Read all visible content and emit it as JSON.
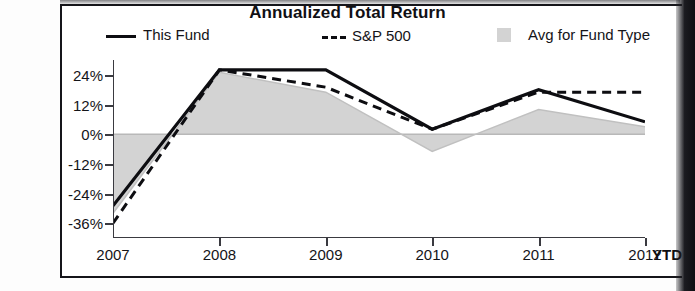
{
  "chart_data": {
    "type": "line",
    "title": "Annualized Total Return",
    "xlabel": "",
    "ylabel": "",
    "x": [
      "2007",
      "2008",
      "2009",
      "2010",
      "2011",
      "2012"
    ],
    "x_last_suffix": "YTD",
    "ylim": [
      -42,
      30
    ],
    "yticks": [
      24,
      12,
      0,
      -12,
      -24,
      -36
    ],
    "ytick_labels": [
      "24%",
      "12%",
      "0%",
      "-12%",
      "-24%",
      "-36%"
    ],
    "grid": false,
    "legend_position": "top",
    "series": [
      {
        "name": "This Fund",
        "style": "solid-line",
        "color": "#0d0d11",
        "values": [
          -29,
          26,
          26,
          2,
          18,
          5
        ]
      },
      {
        "name": "S&P 500",
        "style": "dashed-line",
        "color": "#0d0d11",
        "values": [
          -36,
          26,
          19,
          2,
          17,
          17
        ]
      },
      {
        "name": "Avg for Fund Type",
        "style": "filled-area",
        "color": "#d3d3d3",
        "values": [
          -32,
          25,
          17,
          -7,
          10,
          3
        ]
      }
    ]
  },
  "legend": {
    "fund_label": "This Fund",
    "sp_label": "S&P 500",
    "avg_label": "Avg for Fund Type"
  },
  "colors": {
    "line": "#0d0d11",
    "area_fill": "#d3d3d3",
    "frame": "#15151a",
    "text": "#141418"
  }
}
